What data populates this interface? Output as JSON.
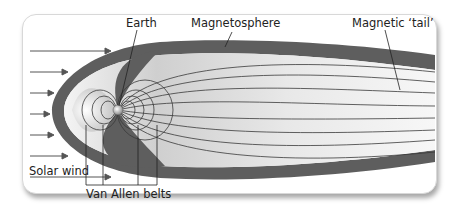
{
  "diagram": {
    "labels": {
      "earth": "Earth",
      "magnetosphere": "Magnetosphere",
      "magnetic_tail": "Magnetic ‘tail’",
      "solar_wind": "Solar wind",
      "van_allen_belts": "Van Allen belts"
    },
    "colors": {
      "outer_sheath": "#5e5e5e",
      "inner_region": "#e6e6e6",
      "field_lines": "#3a3a3a",
      "arrows": "#555555",
      "background": "#ffffff"
    },
    "solar_wind_arrow_count": 6
  }
}
